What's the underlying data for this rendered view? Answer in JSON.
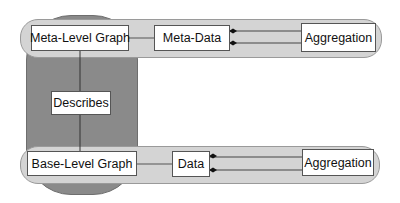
{
  "diagram": {
    "type": "meta-model layers",
    "top_layer": {
      "graph": "Meta-Level Graph",
      "data": "Meta-Data",
      "aggregation": "Aggregation"
    },
    "relation": {
      "label": "Describes"
    },
    "bottom_layer": {
      "graph": "Base-Level Graph",
      "data": "Data",
      "aggregation": "Aggregation"
    },
    "colors": {
      "vertical_band": "#8a8a8a",
      "horizontal_band": "#d4d4d4",
      "box_fill": "#ffffff",
      "line": "#444444"
    }
  }
}
